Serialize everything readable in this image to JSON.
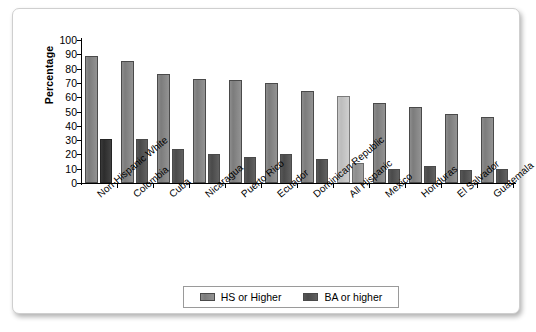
{
  "chart_data": {
    "type": "bar",
    "title": "",
    "xlabel": "",
    "ylabel": "Percentage",
    "ylim": [
      0,
      100
    ],
    "ytick_step": 10,
    "yticks": [
      100,
      90,
      80,
      70,
      60,
      50,
      40,
      30,
      20,
      10,
      0
    ],
    "grid": false,
    "legend_position": "bottom-center",
    "categories": [
      "Non-Hispanic White",
      "Colombia",
      "Cuba",
      "Nicaragua",
      "Puerto Rico",
      "Ecuador",
      "Dominican Republic",
      "All Hispanic",
      "Mexico",
      "Honduras",
      "El Salvador",
      "Guatemala"
    ],
    "highlight_category": "All Hispanic",
    "series": [
      {
        "name": "HS or Higher",
        "color": "#8d8d8d",
        "values": [
          89,
          85,
          76,
          73,
          72,
          70,
          64,
          61,
          56,
          53,
          48,
          46
        ]
      },
      {
        "name": "BA or higher",
        "color": "#4a4a4a",
        "values": [
          31,
          31,
          24,
          20,
          18,
          20,
          17,
          14,
          10,
          12,
          9,
          10
        ]
      }
    ]
  },
  "legend": {
    "items": [
      {
        "label": "HS or Higher"
      },
      {
        "label": "BA or higher"
      }
    ]
  },
  "axis": {
    "y_title": "Percentage"
  }
}
